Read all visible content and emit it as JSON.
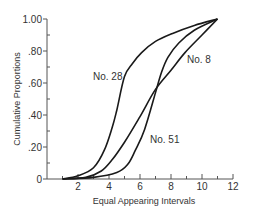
{
  "chart_data": {
    "type": "line",
    "title": "",
    "xlabel": "Equal Appearing Intervals",
    "ylabel": "Cumulative Proportions",
    "xlim": [
      0,
      12
    ],
    "ylim": [
      0,
      1.0
    ],
    "grid": false,
    "legend": "none (curves labeled inline)",
    "x_ticks": [
      {
        "value": 2,
        "label": "2"
      },
      {
        "value": 4,
        "label": "4"
      },
      {
        "value": 6,
        "label": "6"
      },
      {
        "value": 8,
        "label": "8"
      },
      {
        "value": 10,
        "label": "10"
      },
      {
        "value": 12,
        "label": "12"
      }
    ],
    "x_minor_ticks": [
      1,
      3,
      5,
      7,
      9,
      11
    ],
    "y_ticks": [
      {
        "value": 0,
        "label": "0"
      },
      {
        "value": 0.2,
        "label": ".20"
      },
      {
        "value": 0.4,
        "label": ".40"
      },
      {
        "value": 0.6,
        "label": ".60"
      },
      {
        "value": 0.8,
        "label": ".80"
      },
      {
        "value": 1.0,
        "label": "1.00"
      }
    ],
    "y_minor_ticks": [
      0.1,
      0.3,
      0.5,
      0.7,
      0.9
    ],
    "series": [
      {
        "name": "No. 28",
        "label_pos": {
          "x": 93,
          "y": 80
        },
        "points": [
          [
            1.0,
            0.0
          ],
          [
            2.0,
            0.02
          ],
          [
            3.0,
            0.07
          ],
          [
            3.7,
            0.18
          ],
          [
            4.2,
            0.32
          ],
          [
            4.5,
            0.43
          ],
          [
            5.0,
            0.64
          ],
          [
            5.5,
            0.72
          ],
          [
            6.1,
            0.79
          ],
          [
            7.0,
            0.86
          ],
          [
            8.1,
            0.91
          ],
          [
            9.5,
            0.96
          ],
          [
            11.0,
            1.0
          ]
        ]
      },
      {
        "name": "No. 8",
        "label_pos": {
          "x": 187,
          "y": 63
        },
        "points": [
          [
            1.0,
            0.0
          ],
          [
            2.5,
            0.01
          ],
          [
            3.5,
            0.05
          ],
          [
            4.2,
            0.12
          ],
          [
            5.0,
            0.23
          ],
          [
            6.0,
            0.39
          ],
          [
            7.0,
            0.56
          ],
          [
            8.0,
            0.68
          ],
          [
            8.9,
            0.79
          ],
          [
            10.0,
            0.9
          ],
          [
            11.0,
            1.0
          ]
        ]
      },
      {
        "name": "No. 51",
        "label_pos": {
          "x": 150,
          "y": 143
        },
        "points": [
          [
            1.0,
            0.0
          ],
          [
            3.0,
            0.01
          ],
          [
            4.5,
            0.04
          ],
          [
            5.2,
            0.09
          ],
          [
            5.7,
            0.18
          ],
          [
            6.3,
            0.31
          ],
          [
            7.0,
            0.54
          ],
          [
            7.4,
            0.67
          ],
          [
            7.8,
            0.76
          ],
          [
            8.5,
            0.85
          ],
          [
            9.5,
            0.93
          ],
          [
            11.0,
            1.0
          ]
        ]
      }
    ]
  }
}
